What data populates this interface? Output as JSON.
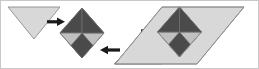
{
  "figure": {
    "background_color": "#ffffff",
    "border_color": "#c8c8c8"
  },
  "palette": {
    "triangle_fill": "#d8d8d8",
    "triangle_stroke": "#8c8c8c",
    "tile_dark": "#4a4a4a",
    "tile_light": "#c0c0c0",
    "tile_stroke": "#707070",
    "arrow_color": "#1a1a1a"
  },
  "shapes": [
    {
      "id": "triangle-down-left",
      "name": "left-down-triangle",
      "kind": "triangle",
      "orientation": "pointing-down",
      "fill": "#d8d8d8",
      "points": "7,6 59,6 33,38"
    },
    {
      "id": "diamond-checker-middle",
      "name": "checkerboard-diamond",
      "kind": "diamond",
      "orientation": "rotated-45",
      "label": "2x2 checkerboard",
      "center_x": 81,
      "center_y": 32,
      "half_width": 22,
      "half_height": 25,
      "tiles": [
        {
          "position": "top",
          "fill": "#4a4a4a",
          "points": "81,7 103,32 81,32 59,32"
        },
        {
          "position": "left",
          "fill": "#c0c0c0",
          "points": "59,32 81,32 81,57 59,32"
        },
        {
          "position": "right",
          "fill": "#c0c0c0",
          "points": "81,32 103,32 81,57 81,32"
        },
        {
          "position": "bottom",
          "fill": "#4a4a4a",
          "points": "59,32 81,57 103,32 81,32"
        }
      ]
    },
    {
      "id": "triangle-up-middle",
      "name": "middle-up-triangle",
      "kind": "triangle",
      "orientation": "pointing-up",
      "fill": "#d8d8d8",
      "points": "113,63 161,63 137,39"
    },
    {
      "id": "parallelogram-result",
      "name": "composed-parallelogram",
      "kind": "parallelogram",
      "fill": "#d8d8d8",
      "points": "161,6 243,6 196,63 114,63"
    }
  ],
  "arrows": [
    {
      "id": "arrow-1",
      "name": "arrow-right-first",
      "direction": "right",
      "x1": 46,
      "y1": 21,
      "x2": 64,
      "y2": 21,
      "meaning": "left triangle moves into composition"
    },
    {
      "id": "arrow-2",
      "name": "arrow-left-second",
      "direction": "left",
      "x1": 117,
      "y1": 49,
      "x2": 99,
      "y2": 49,
      "meaning": "middle triangle moves into composition"
    },
    {
      "id": "arrow-3",
      "name": "arrow-right-third",
      "direction": "right",
      "x1": 140,
      "y1": 30,
      "x2": 158,
      "y2": 30,
      "meaning": "yields the final parallelogram"
    }
  ]
}
